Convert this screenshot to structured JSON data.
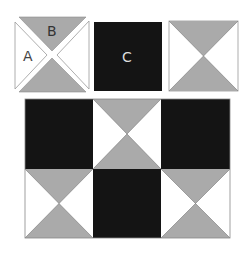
{
  "colors": {
    "gray": "#aaaaaa",
    "black": "#141414",
    "white": "#ffffff",
    "outline": "#888888"
  },
  "pieces": {
    "hourglass_unit": {
      "labels": {
        "side_triangle": "A",
        "top_triangle": "B"
      }
    },
    "solid_square": {
      "label": "C"
    }
  },
  "assembled_grid": {
    "rows": 2,
    "cols": 3,
    "layout": [
      [
        "solid",
        "hourglass",
        "solid"
      ],
      [
        "hourglass",
        "solid",
        "hourglass"
      ]
    ]
  }
}
